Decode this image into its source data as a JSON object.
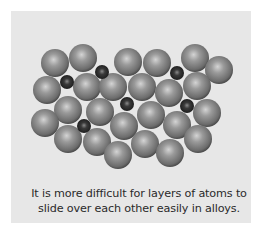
{
  "figure": {
    "caption_lines": [
      "It is more difficult for layers of atoms to",
      "slide over each other easily in alloys."
    ],
    "colors": {
      "background": "#ffffff",
      "panel": "#e7e7e7",
      "large_atom_highlight": "#d4d4d4",
      "large_atom_body": "#7a7a7a",
      "large_atom_edge": "#3c3c3c",
      "small_atom_highlight": "#8a8a8a",
      "small_atom_body": "#2a2a2a",
      "small_atom_edge": "#0e0e0e"
    },
    "large_atom_radius": 14,
    "small_atom_radius": 7,
    "large_atoms": [
      [
        55,
        63
      ],
      [
        83,
        58
      ],
      [
        128,
        62
      ],
      [
        157,
        63
      ],
      [
        195,
        58
      ],
      [
        219,
        70
      ],
      [
        47,
        90
      ],
      [
        87,
        87
      ],
      [
        113,
        87
      ],
      [
        142,
        87
      ],
      [
        169,
        93
      ],
      [
        197,
        86
      ],
      [
        68,
        110
      ],
      [
        100,
        112
      ],
      [
        45,
        123
      ],
      [
        124,
        126
      ],
      [
        151,
        115
      ],
      [
        177,
        125
      ],
      [
        207,
        113
      ],
      [
        68,
        139
      ],
      [
        97,
        142
      ],
      [
        118,
        155
      ],
      [
        145,
        144
      ],
      [
        170,
        153
      ],
      [
        198,
        139
      ]
    ],
    "small_atoms": [
      [
        67,
        82
      ],
      [
        102,
        72
      ],
      [
        177,
        73
      ],
      [
        127,
        104
      ],
      [
        187,
        106
      ],
      [
        84,
        126
      ]
    ]
  }
}
